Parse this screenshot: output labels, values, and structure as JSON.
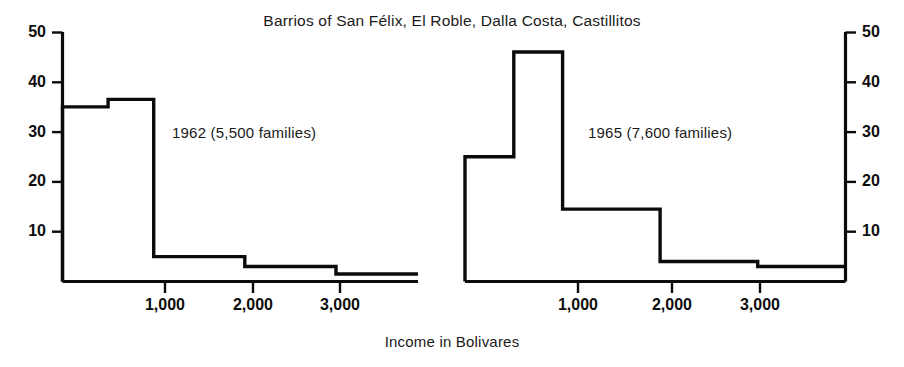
{
  "figure": {
    "title": "Barrios of San Félix, El Roble, Dalla Costa, Castillitos",
    "xlabel": "Income in Bolivares"
  },
  "chart_data": {
    "type": "bar",
    "title": "Barrios of San Félix, El Roble, Dalla Costa, Castillitos",
    "xlabel": "Income in Bolivares",
    "ylabel": "",
    "grid": false,
    "legend": "none",
    "ylim": [
      0,
      50
    ],
    "yticks": [
      10,
      20,
      30,
      40,
      50
    ],
    "ytick_labels": [
      "10",
      "20",
      "30",
      "40",
      "50"
    ],
    "xticks": [
      1000,
      2000,
      3000
    ],
    "xtick_labels": [
      "1,000",
      "2,000",
      "3,000"
    ],
    "xlim": [
      0,
      3900
    ],
    "panels": [
      {
        "name": "1962",
        "annotation": "1962 (5,500 families)",
        "families": "5,500",
        "year": "1962",
        "bin_edges": [
          0,
          500,
          1000,
          2000,
          3000,
          3900
        ],
        "values": [
          35,
          36.5,
          5,
          3,
          1.5
        ]
      },
      {
        "name": "1965",
        "annotation": "1965 (7,600 families)",
        "families": "7,600",
        "year": "1965",
        "bin_edges": [
          0,
          500,
          1000,
          2000,
          3000,
          3900
        ],
        "values": [
          25,
          46,
          14.5,
          4,
          3
        ]
      }
    ]
  },
  "axes": {
    "left": {
      "ticks": [
        {
          "label": "50",
          "value": 50
        },
        {
          "label": "40",
          "value": 40
        },
        {
          "label": "30",
          "value": 30
        },
        {
          "label": "20",
          "value": 20
        },
        {
          "label": "10",
          "value": 10
        }
      ]
    },
    "right": {
      "ticks": [
        {
          "label": "50",
          "value": 50
        },
        {
          "label": "40",
          "value": 40
        },
        {
          "label": "30",
          "value": 30
        },
        {
          "label": "20",
          "value": 20
        },
        {
          "label": "10",
          "value": 10
        }
      ]
    },
    "x_left": {
      "ticks": [
        {
          "label": "1,000",
          "value": 1000
        },
        {
          "label": "2,000",
          "value": 2000
        },
        {
          "label": "3,000",
          "value": 3000
        }
      ]
    },
    "x_right": {
      "ticks": [
        {
          "label": "1,000",
          "value": 1000
        },
        {
          "label": "2,000",
          "value": 2000
        },
        {
          "label": "3,000",
          "value": 3000
        }
      ]
    }
  },
  "colors": {
    "ink": "#0b0b0b",
    "background": "#ffffff"
  }
}
